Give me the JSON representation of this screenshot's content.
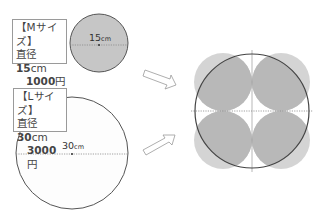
{
  "m_size": {
    "title": "【Mサイズ】",
    "diameter_prefix": "直径 ",
    "diameter_value": "15",
    "diameter_unit": "cm",
    "price_value": "1000",
    "price_unit": "円",
    "dimension_value": "15",
    "dimension_unit": "cm"
  },
  "l_size": {
    "title": "【Lサイズ】",
    "diameter_prefix": "直径 ",
    "diameter_value": "30",
    "diameter_unit": "cm",
    "price_value": "3000",
    "price_unit": "円",
    "dimension_value": "30",
    "dimension_unit": "cm"
  },
  "colors": {
    "circle_fill": "#c8c8c8",
    "small_circle_fill": "#cdcdcd",
    "outline": "#555555",
    "white_circle_fill": "#fdfdfd"
  },
  "comparison": {
    "large_circle_diameter": "30cm",
    "small_circles_count": 4,
    "small_circle_diameter": "15cm"
  }
}
